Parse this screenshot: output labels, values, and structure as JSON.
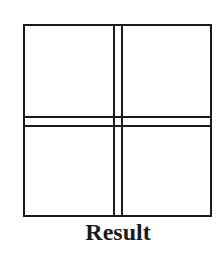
{
  "diagram": {
    "caption": "Result",
    "colors": {
      "stroke": "#1a1a1a",
      "background": "#ffffff"
    },
    "quadrants": [
      {
        "position": "top-left"
      },
      {
        "position": "top-right"
      },
      {
        "position": "bottom-left"
      },
      {
        "position": "bottom-right"
      }
    ]
  }
}
